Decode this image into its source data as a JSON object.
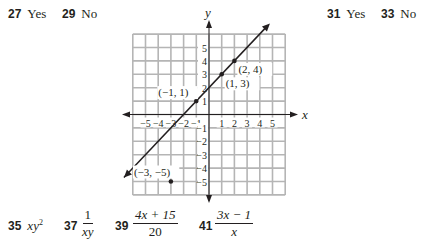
{
  "answers_top": [
    {
      "num": "27",
      "text": "Yes"
    },
    {
      "num": "29",
      "text": "No"
    },
    {
      "num": "31",
      "text": "Yes"
    },
    {
      "num": "33",
      "text": "No"
    }
  ],
  "answers_bottom": [
    {
      "num": "35",
      "expr": "xy",
      "sup": "2"
    },
    {
      "num": "37",
      "numerator": "1",
      "denominator": "xy"
    },
    {
      "num": "39",
      "numerator": "4x + 15",
      "denominator": "20"
    },
    {
      "num": "41",
      "numerator": "3x − 1",
      "denominator": "x"
    }
  ],
  "graph": {
    "x_axis_label": "x",
    "y_axis_label": "y",
    "x_ticks": [
      "−5",
      "−4",
      "−3",
      "−2",
      "−1",
      "1",
      "2",
      "3",
      "4",
      "5"
    ],
    "y_ticks": [
      "5",
      "4",
      "3",
      "2",
      "1",
      "−1",
      "−2",
      "−3",
      "−4",
      "−5"
    ],
    "grid_range": [
      -6,
      6
    ],
    "line": {
      "equation": "y = x + 2",
      "from": [
        -6.7,
        -4.7
      ],
      "to": [
        4.8,
        6.8
      ]
    },
    "points": [
      {
        "label": "(2, 4)",
        "x": 2,
        "y": 4
      },
      {
        "label": "(1, 3)",
        "x": 1,
        "y": 3
      },
      {
        "label": "(−1, 1)",
        "x": -1,
        "y": 1
      },
      {
        "label": "(−3, −5)",
        "x": -3,
        "y": -5
      }
    ]
  }
}
